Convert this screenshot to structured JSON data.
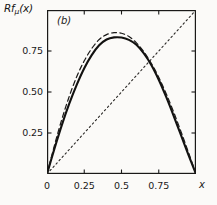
{
  "figure": {
    "panel_label": "(b)",
    "background_color": "#fbfaf8",
    "ink_color": "#1a1918"
  },
  "chart_data": {
    "type": "line",
    "title": "",
    "subtitle": "",
    "panel": "(b)",
    "xlabel": "x",
    "ylabel": "Rfμ(x)",
    "ylabel_base": "Rf",
    "ylabel_subscript": "μ",
    "ylabel_arg": "(x)",
    "xlim": [
      0,
      1
    ],
    "ylim": [
      0,
      1
    ],
    "grid": false,
    "legend": "none",
    "xticks": [
      0,
      0.25,
      0.5,
      0.75
    ],
    "xtick_labels": [
      "0",
      "0.25",
      "0.5",
      "0.75"
    ],
    "yticks": [
      0.25,
      0.5,
      0.75
    ],
    "ytick_labels": [
      "0.25",
      "0.50",
      "0.75"
    ],
    "tick_direction": "in",
    "frame": "box",
    "series": [
      {
        "name": "Rf-mu renormalized map",
        "style": "solid",
        "color": "#121110",
        "width": 2.1,
        "peak_x": 0.5,
        "peak_y": 0.83,
        "x": [
          0,
          0.05,
          0.1,
          0.15,
          0.2,
          0.25,
          0.3,
          0.35,
          0.4,
          0.45,
          0.5,
          0.55,
          0.6,
          0.65,
          0.7,
          0.75,
          0.8,
          0.85,
          0.9,
          0.95,
          1
        ],
        "values": [
          0.0,
          0.155,
          0.3,
          0.43,
          0.545,
          0.645,
          0.725,
          0.785,
          0.82,
          0.833,
          0.832,
          0.818,
          0.788,
          0.735,
          0.665,
          0.575,
          0.47,
          0.355,
          0.235,
          0.115,
          0.0
        ]
      },
      {
        "name": "logistic map f-mu",
        "style": "dashed",
        "color": "#1a1918",
        "width": 1.2,
        "peak_x": 0.48,
        "peak_y": 0.862,
        "x": [
          0,
          0.05,
          0.1,
          0.15,
          0.2,
          0.25,
          0.3,
          0.35,
          0.4,
          0.45,
          0.5,
          0.55,
          0.6,
          0.65,
          0.7,
          0.75,
          0.8,
          0.85,
          0.9,
          0.95,
          1
        ],
        "values": [
          0.0,
          0.175,
          0.335,
          0.475,
          0.595,
          0.69,
          0.765,
          0.82,
          0.85,
          0.862,
          0.858,
          0.838,
          0.8,
          0.745,
          0.675,
          0.59,
          0.49,
          0.378,
          0.257,
          0.131,
          0.0
        ]
      },
      {
        "name": "identity line y = x",
        "style": "dotted",
        "color": "#2a2826",
        "width": 1.1,
        "x": [
          0,
          1
        ],
        "values": [
          0,
          1
        ]
      }
    ]
  }
}
